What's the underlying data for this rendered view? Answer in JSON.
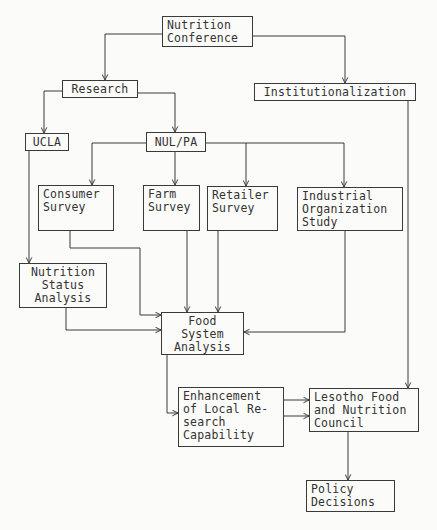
{
  "diagram": {
    "type": "flowchart",
    "nodes": {
      "nutrition_conference": "Nutrition\nConference",
      "research": "Research",
      "institutionalization": "Institutionalization",
      "ucla": "UCLA",
      "nul_pa": "NUL/PA",
      "consumer_survey": "Consumer\nSurvey",
      "farm_survey": "Farm\nSurvey",
      "retailer_survey": "Retailer\nSurvey",
      "industrial_org_study": "Industrial\nOrganization\nStudy",
      "nutrition_status_analysis": "Nutrition\nStatus\nAnalysis",
      "food_system_analysis": "Food\nSystem\nAnalysis",
      "enhancement": "Enhancement\nof Local Re-\nsearch\nCapability",
      "lesotho_council": "Lesotho Food\nand Nutrition\nCouncil",
      "policy_decisions": "Policy\nDecisions"
    },
    "edges": [
      {
        "from": "Nutrition Conference",
        "to": "Research"
      },
      {
        "from": "Nutrition Conference",
        "to": "Institutionalization"
      },
      {
        "from": "Research",
        "to": "UCLA"
      },
      {
        "from": "Research",
        "to": "NUL/PA"
      },
      {
        "from": "NUL/PA",
        "to": "Consumer Survey"
      },
      {
        "from": "NUL/PA",
        "to": "Farm Survey"
      },
      {
        "from": "NUL/PA",
        "to": "Retailer Survey"
      },
      {
        "from": "NUL/PA",
        "to": "Industrial Organization Study"
      },
      {
        "from": "UCLA",
        "to": "Nutrition Status Analysis"
      },
      {
        "from": "Consumer Survey",
        "to": "Food System Analysis"
      },
      {
        "from": "Farm Survey",
        "to": "Food System Analysis"
      },
      {
        "from": "Retailer Survey",
        "to": "Food System Analysis"
      },
      {
        "from": "Industrial Organization Study",
        "to": "Food System Analysis"
      },
      {
        "from": "Nutrition Status Analysis",
        "to": "Food System Analysis"
      },
      {
        "from": "Food System Analysis",
        "to": "Enhancement of Local Research Capability"
      },
      {
        "from": "Enhancement of Local Research Capability",
        "to": "Lesotho Food and Nutrition Council"
      },
      {
        "from": "Enhancement of Local Research Capability",
        "to": "Lesotho Food and Nutrition Council"
      },
      {
        "from": "Institutionalization",
        "to": "Lesotho Food and Nutrition Council"
      },
      {
        "from": "Lesotho Food and Nutrition Council",
        "to": "Policy Decisions"
      }
    ],
    "colors": {
      "line": "#3a3a3a",
      "background": "#fbfbf9",
      "text": "#333333"
    }
  }
}
